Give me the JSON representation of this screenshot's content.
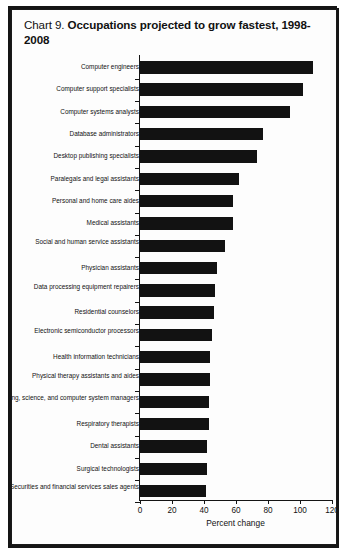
{
  "chart_data": {
    "type": "bar",
    "orientation": "horizontal",
    "title_prefix": "Chart 9.",
    "title": "Occupations projected to grow fastest, 1998-2008",
    "xlabel": "Percent change",
    "ylabel": "",
    "xlim": [
      0,
      120
    ],
    "xticks": [
      0,
      20,
      40,
      60,
      80,
      100,
      120
    ],
    "grid": false,
    "legend": null,
    "categories": [
      "Computer engineers",
      "Computer support specialists",
      "Computer systems analysts",
      "Database administrators",
      "Desktop publishing specialists",
      "Paralegals and legal assistants",
      "Personal and home care aides",
      "Medical assistants",
      "Social and human service assistants",
      "Physician assistants",
      "Data processing equipment repairers",
      "Residential counselors",
      "Electronic semiconductor processors",
      "Health information technicians",
      "Physical therapy assistants and aides",
      "Engineering, science, and computer system managers",
      "Respiratory therapists",
      "Dental assistants",
      "Surgical technologists",
      "Securities and financial services sales agents"
    ],
    "values": [
      108,
      102,
      94,
      77,
      73,
      62,
      58,
      58,
      53,
      48,
      47,
      46,
      45,
      44,
      44,
      43,
      43,
      42,
      42,
      41
    ]
  },
  "frame": {
    "border_color": "#151515",
    "bar_color": "#121212",
    "axis_color": "#141414",
    "background": "#fdfdfd"
  }
}
